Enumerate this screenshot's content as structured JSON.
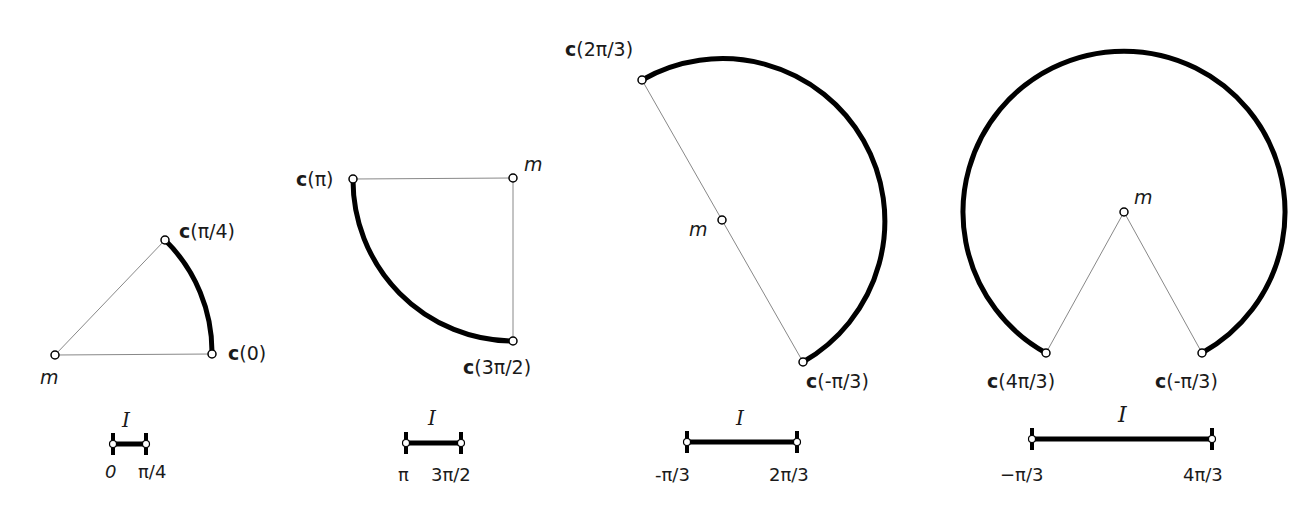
{
  "colors": {
    "curve": "#000000",
    "chord": "#888888",
    "text": "#1a1a1a",
    "background": "#ffffff"
  },
  "panels": [
    {
      "center_label": "m",
      "start_label": {
        "fn": "c",
        "arg": "(0)"
      },
      "end_label": {
        "fn": "c",
        "arg": "(π/4)"
      },
      "interval": {
        "name": "I",
        "lower": "0",
        "upper": "π/4"
      }
    },
    {
      "center_label": "m",
      "start_label": {
        "fn": "c",
        "arg": "(π)"
      },
      "end_label": {
        "fn": "c",
        "arg": "(3π/2)"
      },
      "interval": {
        "name": "I",
        "lower": "π",
        "upper": "3π/2"
      }
    },
    {
      "center_label": "m",
      "start_label": {
        "fn": "c",
        "arg": "(2π/3)"
      },
      "end_label": {
        "fn": "c",
        "arg": "(-π/3)"
      },
      "interval": {
        "name": "I",
        "lower": "-π/3",
        "upper": "2π/3"
      }
    },
    {
      "center_label": "m",
      "start_label": {
        "fn": "c",
        "arg": "(4π/3)"
      },
      "end_label": {
        "fn": "c",
        "arg": "(-π/3)"
      },
      "interval": {
        "name": "I",
        "lower": "−π/3",
        "upper": "4π/3"
      }
    }
  ]
}
